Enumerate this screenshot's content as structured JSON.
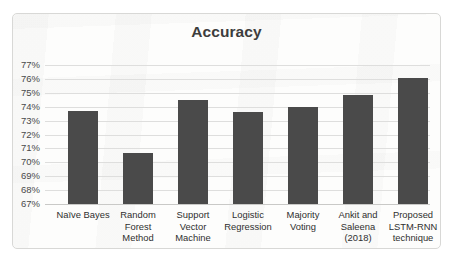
{
  "chart_data": {
    "type": "bar",
    "title": "Accuracy",
    "xlabel": "",
    "ylabel": "",
    "ylim": [
      67,
      77
    ],
    "ytick_labels": [
      "77%",
      "76%",
      "75%",
      "74%",
      "73%",
      "72%",
      "71%",
      "70%",
      "69%",
      "68%",
      "67%"
    ],
    "ytick_values": [
      77,
      76,
      75,
      74,
      73,
      72,
      71,
      70,
      69,
      68,
      67
    ],
    "grid": true,
    "legend": "none",
    "unit": "%",
    "bar_color": "#4a4a4a",
    "categories": [
      "Naïve Bayes",
      "Random Forest Method",
      "Support Vector Machine",
      "Logistic Regression",
      "Majority Voting",
      "Ankit and Saleena (2018)",
      "Proposed LSTM-RNN technique"
    ],
    "category_lines": [
      [
        "Naïve Bayes"
      ],
      [
        "Random",
        "Forest",
        "Method"
      ],
      [
        "Support",
        "Vector",
        "Machine"
      ],
      [
        "Logistic",
        "Regression"
      ],
      [
        "Majority",
        "Voting"
      ],
      [
        "Ankit and",
        "Saleena",
        "(2018)"
      ],
      [
        "Proposed",
        "LSTM-RNN",
        "technique"
      ]
    ],
    "values": [
      73.7,
      70.65,
      74.5,
      73.6,
      74.0,
      74.85,
      76.1
    ]
  }
}
